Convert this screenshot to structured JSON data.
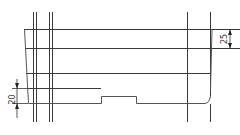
{
  "drawing": {
    "type": "technical-line-drawing",
    "colors": {
      "line": "#3a3a3a",
      "background": "#ffffff"
    },
    "dimensions": [
      {
        "id": "left-dimension",
        "label": "20",
        "orientation": "vertical"
      },
      {
        "id": "right-dimension",
        "label": "25",
        "orientation": "vertical"
      }
    ]
  }
}
